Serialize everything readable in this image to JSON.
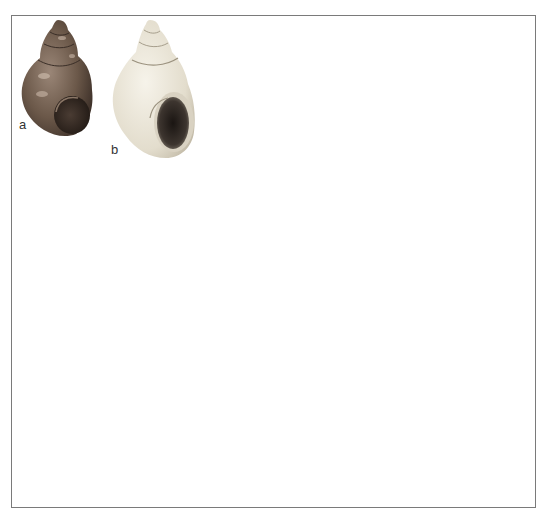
{
  "figure": {
    "panels": [
      {
        "label": "a",
        "subject": "dark-brown-spired-snail-shell",
        "color": "#6e5a4c"
      },
      {
        "label": "b",
        "subject": "pale-cream-spired-snail-shell",
        "color": "#e9e4d6"
      }
    ],
    "frame_color": "#7a7a7a"
  }
}
